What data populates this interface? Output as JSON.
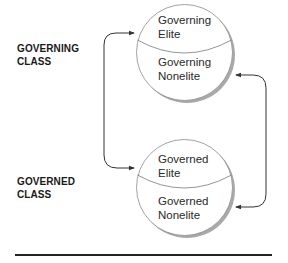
{
  "diagram": {
    "classes": [
      {
        "id": "governing",
        "label_line1": "GOVERNING",
        "label_line2": "CLASS",
        "upper_segment": {
          "line1": "Governing",
          "line2": "Elite"
        },
        "lower_segment": {
          "line1": "Governing",
          "line2": "Nonelite"
        }
      },
      {
        "id": "governed",
        "label_line1": "GOVERNED",
        "label_line2": "CLASS",
        "upper_segment": {
          "line1": "Governed",
          "line2": "Elite"
        },
        "lower_segment": {
          "line1": "Governed",
          "line2": "Nonelite"
        }
      }
    ],
    "connections": [
      {
        "from": "Governed Elite",
        "to": "Governing Elite",
        "side": "left",
        "bidirectional": true
      },
      {
        "from": "Governing Nonelite",
        "to": "Governed Nonelite",
        "side": "right",
        "bidirectional": true
      }
    ],
    "colors": {
      "stroke": "#333333",
      "circle_outline": "#8a8a8a",
      "shadow": "#9a9a9a",
      "text": "#2a2a2a",
      "label": "#1a1a1a",
      "rule": "#222222"
    }
  }
}
